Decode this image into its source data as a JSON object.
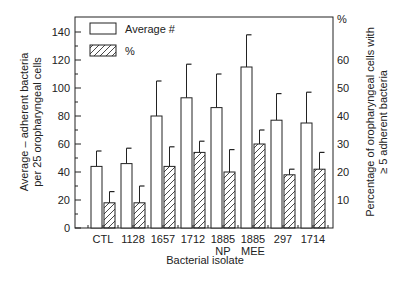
{
  "chart_data": {
    "type": "bar",
    "title": "",
    "xlabel": "Bacterial isolate",
    "ylabel": "Average – adherent bacteria per 25 oropharyngeal cells",
    "ylabel_lines": [
      "Average – adherent bacteria",
      "per 25 oropharyngeal cells"
    ],
    "y2label": "Percentage of oropharyngeal cells with ≥ 5 adherent bacteria",
    "y2label_lines": [
      "Percentage of oropharyngeal cells with",
      "≥ 5 adherent bacteria"
    ],
    "y2unit": "%",
    "categories": [
      "CTL",
      "1128",
      "1657",
      "1712",
      "1885\nNP",
      "1885\nMEE",
      "297",
      "1714"
    ],
    "category_lines": [
      [
        "CTL"
      ],
      [
        "1128"
      ],
      [
        "1657"
      ],
      [
        "1712"
      ],
      [
        "1885",
        "NP"
      ],
      [
        "1885",
        "MEE"
      ],
      [
        "297"
      ],
      [
        "1714"
      ]
    ],
    "ylim": [
      0,
      140
    ],
    "yticks": [
      0,
      20,
      40,
      60,
      80,
      100,
      120,
      140
    ],
    "y2lim": [
      0,
      70
    ],
    "y2ticks": [
      10,
      20,
      30,
      40,
      50,
      60
    ],
    "grid": false,
    "legend_position": "upper left (inside)",
    "series": [
      {
        "name": "Average #",
        "axis": "left",
        "fill": "open",
        "values": [
          44,
          46,
          80,
          93,
          86,
          115,
          77,
          75
        ],
        "error_upper": [
          55,
          57,
          105,
          117,
          110,
          138,
          96,
          97
        ]
      },
      {
        "name": "%",
        "axis": "right",
        "fill": "hatched",
        "values": [
          9,
          9,
          22,
          27,
          20,
          30,
          19,
          21
        ],
        "error_upper": [
          13,
          15,
          29,
          31,
          28,
          35,
          21,
          27
        ]
      }
    ]
  },
  "legend": {
    "items": [
      "Average #",
      "%"
    ]
  },
  "colors": {
    "ink": "#222222",
    "background": "#ffffff"
  }
}
